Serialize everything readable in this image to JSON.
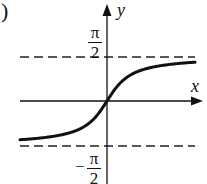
{
  "panel_label": ")",
  "chart_data": {
    "type": "line",
    "title": "",
    "function": "y = arctan(x)",
    "xlabel": "x",
    "ylabel": "y",
    "ytick_labels": [
      "π/2",
      "−π/2"
    ],
    "asymptotes": [
      {
        "y": "π/2",
        "style": "dashed"
      },
      {
        "y": "−π/2",
        "style": "dashed"
      }
    ],
    "series": [
      {
        "name": "arctan(x)",
        "x": [
          -6,
          -4,
          -2,
          -1,
          0,
          1,
          2,
          4,
          6
        ],
        "y": [
          -1.41,
          -1.33,
          -1.11,
          -0.785,
          0,
          0.785,
          1.11,
          1.33,
          1.41
        ]
      }
    ],
    "grid": false,
    "legend": "none"
  },
  "labels": {
    "x_axis": "x",
    "y_axis": "y",
    "upper_num": "π",
    "upper_den": "2",
    "lower_sign": "−",
    "lower_num": "π",
    "lower_den": "2"
  },
  "colors": {
    "ink": "#111111",
    "background": "#ffffff"
  }
}
